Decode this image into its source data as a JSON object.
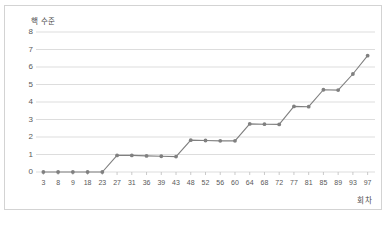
{
  "chart_data": {
    "type": "line",
    "title": "",
    "ylabel": "핵 수준",
    "xlabel": "회차",
    "ylim": [
      0,
      8
    ],
    "yticks": [
      0,
      1,
      2,
      3,
      4,
      5,
      6,
      7,
      8
    ],
    "grid": true,
    "legend": "none",
    "marker": "circle",
    "line_color": "#808080",
    "marker_color": "#808080",
    "grid_color": "#d9d9d9",
    "categories": [
      "3",
      "8",
      "9",
      "18",
      "23",
      "27",
      "31",
      "36",
      "39",
      "43",
      "48",
      "52",
      "56",
      "60",
      "64",
      "68",
      "72",
      "77",
      "81",
      "85",
      "89",
      "93",
      "97"
    ],
    "values": [
      0,
      0,
      0,
      0,
      0,
      0.95,
      0.95,
      0.92,
      0.9,
      0.88,
      1.82,
      1.8,
      1.78,
      1.78,
      2.75,
      2.73,
      2.72,
      3.75,
      3.73,
      4.7,
      4.68,
      5.6,
      6.65
    ]
  },
  "axes": {
    "y_axis_title": "핵 수준",
    "x_axis_title": "회차"
  }
}
